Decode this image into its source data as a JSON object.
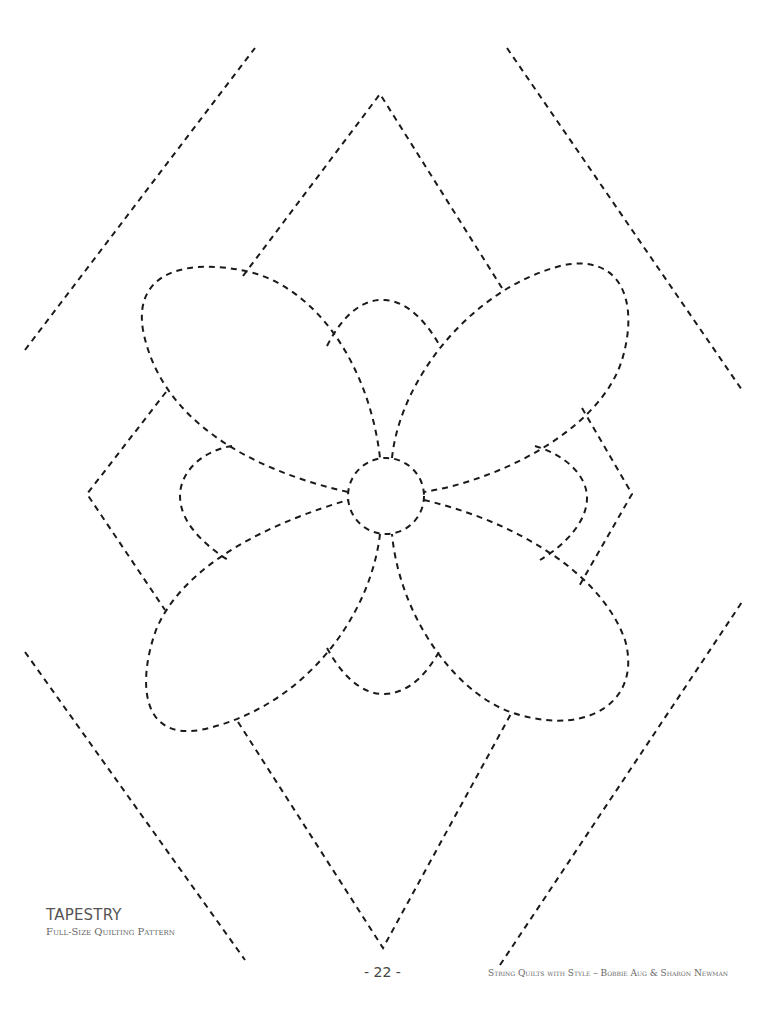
{
  "document": {
    "title": "TAPESTRY",
    "subtitle": "Full-Size Quilting Pattern",
    "page_number": "- 22 -",
    "credit": "String Quilts with Style – Bobbie Aug & Sharon Newman"
  },
  "pattern": {
    "stroke_color": "#1a1a1a",
    "paths": {
      "border_top_left": "M25 350 L255 48",
      "border_top_right": "M507 48 L742 390",
      "border_bottom_left": "M25 652 L245 960",
      "border_bottom_right": "M500 965 L742 602",
      "center_circle": "M424 496 A38 38 0 1 1 348 496 A38 38 0 1 1 424 496",
      "petal_top_left": "M348 492 C250 470 160 420 143 330 C133 270 190 258 250 272 C320 290 370 370 380 458",
      "petal_top_right": "M392 458 C400 380 470 290 560 266 C620 252 640 300 622 360 C600 430 500 480 424 492",
      "petal_bottom_left": "M380 534 C370 620 300 710 200 730 C140 740 138 680 156 630 C185 560 280 520 348 500",
      "petal_bottom_right": "M424 500 C510 520 600 570 625 640 C642 700 590 735 520 715 C460 700 400 620 392 534",
      "diamond_top": "M243 276 L380 94 L502 288",
      "diamond_bottom": "M238 722 L383 948 L512 712",
      "diamond_left": "M166 392 L87 494 L165 610",
      "diamond_right": "M582 408 L632 494 L578 588",
      "arc_top": "M327 346 C340 320 360 298 385 300 C410 302 428 325 440 346",
      "arc_bottom": "M327 648 C340 672 360 695 385 694 C410 693 428 672 440 650",
      "arc_left": "M232 446 C205 450 180 470 180 496 C180 520 200 542 228 560",
      "arc_right": "M535 446 C565 455 587 475 587 498 C587 522 565 545 540 560",
      "spoke_top_left": "M380 458 L367 420",
      "spoke_top_right": "M392 458 L405 420",
      "spoke_bottom_left": "M380 534 L370 580",
      "spoke_bottom_right": "M392 534 L402 580"
    }
  }
}
